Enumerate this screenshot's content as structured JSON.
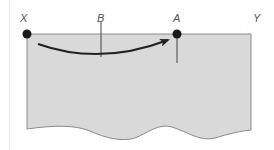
{
  "diagram": {
    "labels": {
      "x": "X",
      "b": "B",
      "a": "A",
      "y": "Y"
    },
    "colors": {
      "body_fill": "#d9d9d9",
      "body_stroke": "#8a8a8a",
      "arrow": "#222222",
      "points": "#1a1a1a",
      "label": "#555555"
    },
    "points": [
      {
        "name": "X",
        "x": 27,
        "y": 34
      },
      {
        "name": "A",
        "x": 177,
        "y": 34
      }
    ],
    "markers": [
      {
        "name": "B",
        "x": 101,
        "y1": 22,
        "y2": 57
      },
      {
        "name": "A",
        "x": 177,
        "y1": 34,
        "y2": 63
      }
    ]
  }
}
